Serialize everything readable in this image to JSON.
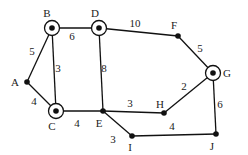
{
  "graph": {
    "nodes": [
      {
        "id": "A",
        "x": 27,
        "y": 82,
        "circled": false,
        "lx": 15,
        "ly": 86
      },
      {
        "id": "B",
        "x": 52,
        "y": 28,
        "circled": true,
        "lx": 47,
        "ly": 17
      },
      {
        "id": "C",
        "x": 56,
        "y": 111,
        "circled": true,
        "lx": 52,
        "ly": 130
      },
      {
        "id": "D",
        "x": 99,
        "y": 28,
        "circled": true,
        "lx": 95,
        "ly": 17
      },
      {
        "id": "E",
        "x": 103,
        "y": 111,
        "circled": false,
        "lx": 99,
        "ly": 127
      },
      {
        "id": "F",
        "x": 178,
        "y": 36,
        "circled": false,
        "lx": 174,
        "ly": 29
      },
      {
        "id": "G",
        "x": 213,
        "y": 73,
        "circled": true,
        "lx": 227,
        "ly": 77
      },
      {
        "id": "H",
        "x": 164,
        "y": 113,
        "circled": false,
        "lx": 160,
        "ly": 108
      },
      {
        "id": "I",
        "x": 132,
        "y": 136,
        "circled": false,
        "lx": 130,
        "ly": 151
      },
      {
        "id": "J",
        "x": 216,
        "y": 134,
        "circled": false,
        "lx": 212,
        "ly": 150
      }
    ],
    "edges": [
      {
        "from": "A",
        "to": "B",
        "weight": "5",
        "wx": 32,
        "wy": 55
      },
      {
        "from": "A",
        "to": "C",
        "weight": "4",
        "wx": 34,
        "wy": 105
      },
      {
        "from": "B",
        "to": "C",
        "weight": "3",
        "wx": 58,
        "wy": 72
      },
      {
        "from": "B",
        "to": "D",
        "weight": "6",
        "wx": 72,
        "wy": 40
      },
      {
        "from": "D",
        "to": "F",
        "weight": "10",
        "wx": 135,
        "wy": 27
      },
      {
        "from": "D",
        "to": "E",
        "weight": "8",
        "wx": 104,
        "wy": 72
      },
      {
        "from": "F",
        "to": "G",
        "weight": "5",
        "wx": 200,
        "wy": 52
      },
      {
        "from": "C",
        "to": "E",
        "weight": "4",
        "wx": 77,
        "wy": 127
      },
      {
        "from": "E",
        "to": "H",
        "weight": "3",
        "wx": 130,
        "wy": 107
      },
      {
        "from": "E",
        "to": "I",
        "weight": "3",
        "wx": 113,
        "wy": 143
      },
      {
        "from": "H",
        "to": "G",
        "weight": "2",
        "wx": 184,
        "wy": 90
      },
      {
        "from": "G",
        "to": "J",
        "weight": "6",
        "wx": 220,
        "wy": 108
      },
      {
        "from": "I",
        "to": "J",
        "weight": "4",
        "wx": 172,
        "wy": 130
      }
    ]
  }
}
